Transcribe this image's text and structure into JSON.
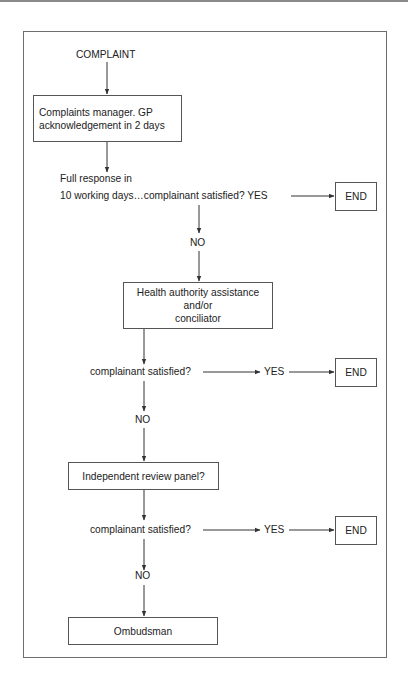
{
  "diagram": {
    "type": "flowchart",
    "start": {
      "label": "COMPLAINT"
    },
    "steps": [
      {
        "id": "complaints-manager",
        "label": "Complaints manager.  GP\nacknowledgement in 2 days"
      },
      {
        "id": "q1-line1",
        "label": "Full response in"
      },
      {
        "id": "q1-line2",
        "label": "10 working days…complainant satisfied?  YES"
      },
      {
        "id": "health-authority",
        "label": "Health authority assistance\nand/or\nconciliator"
      },
      {
        "id": "q2",
        "label": "complainant satisfied?"
      },
      {
        "id": "independent-review",
        "label": "Independent review panel?"
      },
      {
        "id": "q3",
        "label": "complainant satisfied?"
      },
      {
        "id": "ombudsman",
        "label": "Ombudsman"
      }
    ],
    "branch_labels": {
      "yes": "YES",
      "no": "NO",
      "end": "END"
    }
  }
}
